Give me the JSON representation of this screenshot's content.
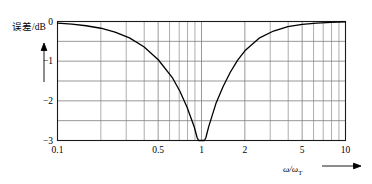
{
  "chart_data": {
    "type": "line",
    "title": "",
    "xlabel": "ω/ωT",
    "ylabel": "误差/dB",
    "xscale": "log",
    "xlim": [
      0.1,
      10
    ],
    "ylim": [
      -3,
      0
    ],
    "grid": true,
    "legend": "none",
    "xticks": [
      0.1,
      0.5,
      1,
      2,
      5,
      10
    ],
    "xticklabels": [
      "0.1",
      "0.5",
      "1",
      "2",
      "5",
      "10"
    ],
    "yticks": [
      0,
      -1,
      -2,
      -3
    ],
    "yticklabels": [
      "0",
      "−1",
      "−2",
      "−3"
    ],
    "y_gridline_values": [
      0,
      -0.5,
      -1,
      -1.5,
      -2,
      -2.5,
      -3
    ],
    "x_gridline_values": [
      0.1,
      0.2,
      0.3,
      0.4,
      0.5,
      0.6,
      0.7,
      0.8,
      0.9,
      1,
      2,
      3,
      4,
      5,
      6,
      7,
      8,
      9,
      10
    ],
    "series": [
      {
        "name": "error",
        "x": [
          0.1,
          0.126,
          0.158,
          0.2,
          0.251,
          0.316,
          0.398,
          0.501,
          0.631,
          0.708,
          0.794,
          0.891,
          0.933,
          0.955,
          0.977,
          1.0,
          1.023,
          1.047,
          1.072,
          1.122,
          1.259,
          1.413,
          1.585,
          1.778,
          2.0,
          2.512,
          3.162,
          3.981,
          5.012,
          6.31,
          7.943,
          10.0
        ],
        "y": [
          -0.043,
          -0.068,
          -0.107,
          -0.17,
          -0.266,
          -0.414,
          -0.637,
          -0.964,
          -1.43,
          -1.76,
          -2.16,
          -2.66,
          -2.93,
          -3.0,
          -3.0,
          -3.0,
          -3.0,
          -3.0,
          -2.93,
          -2.65,
          -2.07,
          -1.64,
          -1.28,
          -0.98,
          -0.74,
          -0.42,
          -0.24,
          -0.13,
          -0.07,
          -0.04,
          -0.02,
          -0.01
        ],
        "minimum_point": {
          "x": 1,
          "y": -3
        },
        "color": "#000000"
      }
    ],
    "annotations": [
      {
        "text": "误差/dB",
        "role": "y-axis-label"
      },
      {
        "text": "ω/ωT",
        "role": "x-axis-label"
      }
    ]
  },
  "axis": {
    "y_label_main": "误差/dB",
    "x_label_omega": "ω/ω",
    "x_label_sub": "T"
  },
  "colors": {
    "curve": "#000000",
    "grid": "#7d7d7d",
    "frame": "#1a1a1a",
    "background": "#ffffff"
  }
}
